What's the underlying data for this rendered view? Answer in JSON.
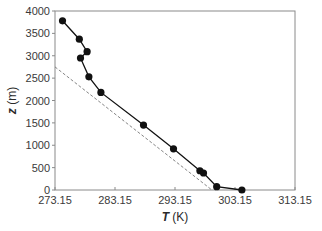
{
  "chart_data": {
    "type": "line",
    "title": "",
    "xlabel": {
      "var": "T",
      "unit": "(K)"
    },
    "ylabel": {
      "var": "z",
      "unit": "(m)"
    },
    "xlim": [
      273.15,
      313.15
    ],
    "ylim": [
      0,
      4000
    ],
    "xticks": [
      "273.15",
      "283.15",
      "293.15",
      "303.15",
      "313.15"
    ],
    "xtick_values": [
      273.15,
      283.15,
      293.15,
      303.15,
      313.15
    ],
    "yticks": [
      "0",
      "500",
      "1000",
      "1500",
      "2000",
      "2500",
      "3000",
      "3500",
      "4000"
    ],
    "ytick_values": [
      0,
      500,
      1000,
      1500,
      2000,
      2500,
      3000,
      3500,
      4000
    ],
    "grid": false,
    "legend": null,
    "series": [
      {
        "name": "measured profile",
        "style": "solid line with filled circle markers",
        "color": "#111111",
        "x": [
          274.4,
          277.2,
          278.5,
          277.4,
          278.8,
          280.8,
          287.9,
          292.9,
          297.3,
          297.9,
          300.1,
          304.3
        ],
        "y": [
          3780,
          3370,
          3090,
          2950,
          2530,
          2180,
          1450,
          920,
          430,
          380,
          75,
          0
        ]
      },
      {
        "name": "reference lapse line",
        "style": "dashed",
        "color": "#777777",
        "x": [
          273.15,
          299.3
        ],
        "y": [
          2750,
          0
        ]
      }
    ]
  },
  "layout": {
    "plot": {
      "left": 55,
      "top": 11,
      "right": 295,
      "bottom": 190
    }
  }
}
